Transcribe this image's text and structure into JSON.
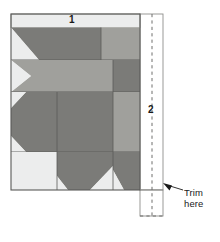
{
  "figure": {
    "type": "quilting-construction-diagram",
    "background_color": "#ffffff"
  },
  "labels": {
    "strip_one": "1",
    "strip_two": "2",
    "trim_line1": "Trim",
    "trim_line2": "here"
  },
  "colors": {
    "light": "#e8e9e4",
    "medium": "#a0a09c",
    "dark": "#7b7b78",
    "outline": "#5a5a58",
    "thin_line": "#8f8f8c",
    "white": "#ffffff",
    "dashed": "#6e6e6c",
    "text": "#1a1a1a"
  },
  "geometry": {
    "block_left": 11,
    "block_top": 14,
    "block_right": 140,
    "block_bottom": 190,
    "strip1_height": 13,
    "panel_right": 163,
    "panel_bottom": 216,
    "dash_x": 152
  },
  "annotations": {
    "arrow_from_x": 186,
    "arrow_from_y": 190,
    "arrow_to_x": 166,
    "arrow_to_y": 184
  }
}
